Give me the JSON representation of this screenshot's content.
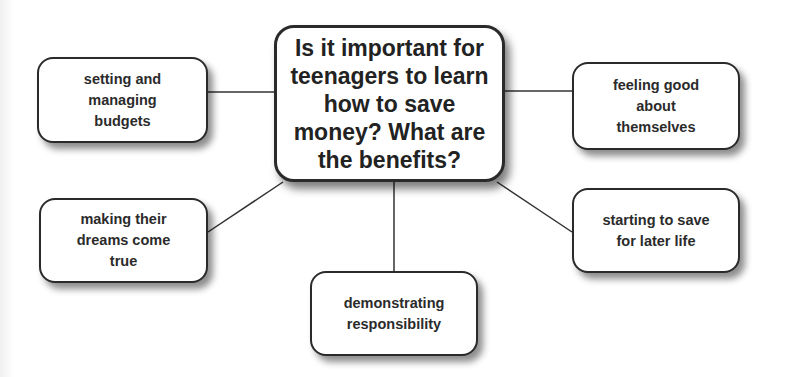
{
  "diagram": {
    "type": "mind-map",
    "central": {
      "text": "Is it important for\nteenagers to learn\nhow to save\nmoney? What are\nthe benefits?"
    },
    "nodes": [
      {
        "id": "budgets",
        "text": "setting and\nmanaging\nbudgets"
      },
      {
        "id": "feeling-good",
        "text": "feeling good\nabout\nthemselves"
      },
      {
        "id": "dreams",
        "text": "making their\ndreams come\ntrue"
      },
      {
        "id": "save-later",
        "text": "starting to save\nfor later life"
      },
      {
        "id": "responsibility",
        "text": "demonstrating\nresponsibility"
      }
    ],
    "colors": {
      "line": "#333333",
      "border": "#2a2a2a",
      "text": "#2b2b2b",
      "background": "#ffffff"
    }
  }
}
